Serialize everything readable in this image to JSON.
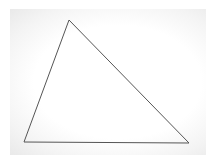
{
  "figure": {
    "shape": "triangle",
    "vertices": [
      {
        "name": "top",
        "x": 69,
        "y": 20
      },
      {
        "name": "bottom-left",
        "x": 24,
        "y": 142
      },
      {
        "name": "bottom-right",
        "x": 189,
        "y": 143
      }
    ],
    "stroke_color": "#555555",
    "fill": "none",
    "background_color": "#ffffff"
  }
}
